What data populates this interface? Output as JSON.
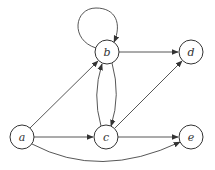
{
  "diagram": {
    "type": "directed-graph",
    "node_radius": 12,
    "nodes": [
      {
        "id": "a",
        "label": "a",
        "x": 22,
        "y": 137
      },
      {
        "id": "b",
        "label": "b",
        "x": 107,
        "y": 52
      },
      {
        "id": "c",
        "label": "c",
        "x": 106,
        "y": 137
      },
      {
        "id": "d",
        "label": "d",
        "x": 191,
        "y": 52
      },
      {
        "id": "e",
        "label": "e",
        "x": 191,
        "y": 137
      }
    ],
    "edges": [
      {
        "from": "a",
        "to": "b"
      },
      {
        "from": "a",
        "to": "c"
      },
      {
        "from": "a",
        "to": "e",
        "curved": true
      },
      {
        "from": "b",
        "to": "b",
        "self_loop": true
      },
      {
        "from": "b",
        "to": "d"
      },
      {
        "from": "b",
        "to": "c",
        "curved": true
      },
      {
        "from": "c",
        "to": "b",
        "curved": true
      },
      {
        "from": "c",
        "to": "d"
      },
      {
        "from": "c",
        "to": "e"
      }
    ]
  }
}
